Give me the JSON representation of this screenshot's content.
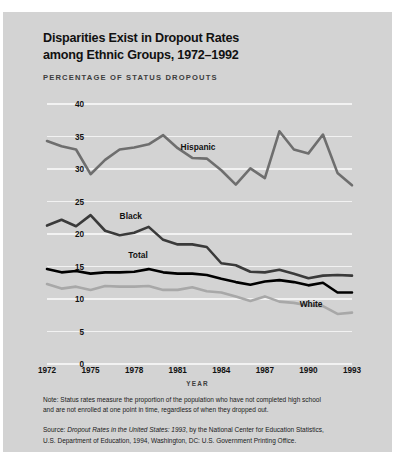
{
  "title_line1": "Disparities Exist in Dropout Rates",
  "title_line2": "among Ethnic Groups, 1972–1992",
  "subtitle": "PERCENTAGE OF STATUS DROPOUTS",
  "xlabel": "YEAR",
  "notes": {
    "note_line1": "Note: Status rates measure the proportion of the population who have not completed high school",
    "note_line2": "and are not enrolled at one point in time, regardless of when they dropped out.",
    "source_prefix": "Source: ",
    "source_italic": "Dropout Rates in the United States: 1993",
    "source_rest": ", by the National Center for Education Statistics,",
    "source_line2": "U.S. Department of Education, 1994, Washington, DC: U.S. Government Printing Office."
  },
  "colors": {
    "background": "#d3d3d3",
    "gridline": "#f2f2f2",
    "hispanic": "#6e6e6e",
    "black": "#3a3a3a",
    "total": "#000000",
    "white": "#a8a8a8",
    "text": "#111111"
  },
  "chart_data": {
    "type": "line",
    "title": "Disparities Exist in Dropout Rates among Ethnic Groups, 1972–1992",
    "xlabel": "YEAR",
    "ylabel": "PERCENTAGE OF STATUS DROPOUTS",
    "xlim": [
      1972,
      1993
    ],
    "ylim": [
      0,
      40
    ],
    "yticks": [
      0,
      5,
      10,
      15,
      20,
      25,
      30,
      35,
      40
    ],
    "xticks": [
      1972,
      1975,
      1978,
      1981,
      1984,
      1987,
      1990,
      1993
    ],
    "grid": "horizontal",
    "legend": "inline-labels",
    "x": [
      1972,
      1973,
      1974,
      1975,
      1976,
      1977,
      1978,
      1979,
      1980,
      1981,
      1982,
      1983,
      1984,
      1985,
      1986,
      1987,
      1988,
      1989,
      1990,
      1991,
      1992,
      1993
    ],
    "series": [
      {
        "name": "Hispanic",
        "color": "#6e6e6e",
        "label_x": 1981.2,
        "label_y": 33.2,
        "values": [
          34.3,
          33.5,
          33.0,
          29.2,
          31.4,
          33.0,
          33.3,
          33.8,
          35.2,
          33.2,
          31.7,
          31.6,
          29.8,
          27.6,
          30.1,
          28.6,
          35.8,
          33.0,
          32.4,
          35.3,
          29.4,
          27.5
        ]
      },
      {
        "name": "Black",
        "color": "#3a3a3a",
        "label_x": 1977.0,
        "label_y": 22.6,
        "values": [
          21.3,
          22.2,
          21.2,
          22.9,
          20.5,
          19.8,
          20.2,
          21.1,
          19.1,
          18.4,
          18.4,
          18.0,
          15.5,
          15.2,
          14.2,
          14.1,
          14.5,
          13.9,
          13.2,
          13.6,
          13.7,
          13.6
        ]
      },
      {
        "name": "Total",
        "color": "#000000",
        "label_x": 1977.6,
        "label_y": 16.6,
        "values": [
          14.6,
          14.1,
          14.3,
          13.9,
          14.1,
          14.1,
          14.2,
          14.6,
          14.1,
          13.9,
          13.9,
          13.7,
          13.1,
          12.6,
          12.2,
          12.7,
          12.9,
          12.6,
          12.1,
          12.5,
          11.0,
          11.0
        ]
      },
      {
        "name": "White",
        "color": "#a8a8a8",
        "label_x": 1989.4,
        "label_y": 9.1,
        "values": [
          12.3,
          11.6,
          11.9,
          11.4,
          12.0,
          11.9,
          11.9,
          12.0,
          11.4,
          11.4,
          11.8,
          11.2,
          11.0,
          10.4,
          9.7,
          10.4,
          9.6,
          9.4,
          9.0,
          8.9,
          7.7,
          7.9
        ]
      }
    ]
  }
}
